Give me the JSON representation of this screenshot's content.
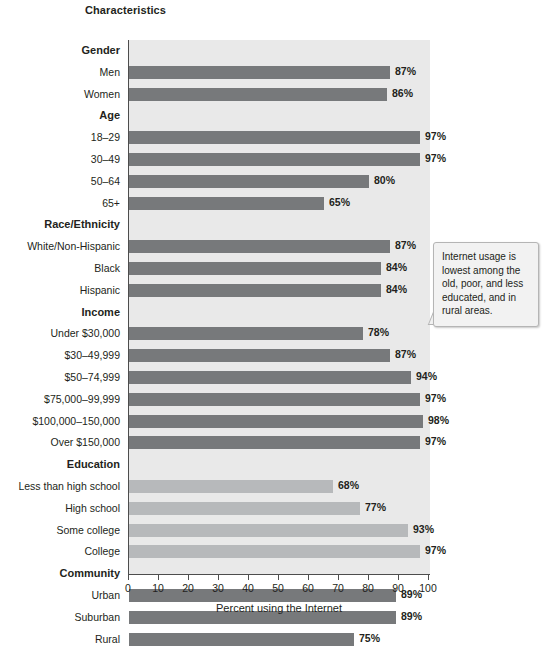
{
  "header": {
    "characteristics_label": "Characteristics"
  },
  "callout": {
    "text": "Internet usage is lowest among the old, poor, and less educated, and in rural areas."
  },
  "axis": {
    "title": "Percent using the Internet",
    "ticks": [
      "0",
      "10",
      "20",
      "30",
      "40",
      "50",
      "60",
      "70",
      "80",
      "90",
      "100"
    ]
  },
  "colors": {
    "bar_dark": "#77797b",
    "bar_light": "#b7b9bb",
    "plot_background": "#e9e9e9",
    "axis": "#4d4d4d",
    "text": "#231f20"
  },
  "chart_data": {
    "type": "bar",
    "orientation": "horizontal",
    "title": "Percent using the Internet",
    "xlabel": "Percent using the Internet",
    "ylabel": "Characteristics",
    "xlim": [
      0,
      100
    ],
    "xticks": [
      0,
      10,
      20,
      30,
      40,
      50,
      60,
      70,
      80,
      90,
      100
    ],
    "grid": false,
    "legend": null,
    "value_suffix": "%",
    "groups": [
      {
        "name": "Gender",
        "shade": "dark",
        "categories": [
          "Men",
          "Women"
        ],
        "values": [
          87,
          86
        ],
        "labels": [
          "87%",
          "86%"
        ]
      },
      {
        "name": "Age",
        "shade": "dark",
        "categories": [
          "18–29",
          "30–49",
          "50–64",
          "65+"
        ],
        "values": [
          97,
          97,
          80,
          65
        ],
        "labels": [
          "97%",
          "97%",
          "80%",
          "65%"
        ]
      },
      {
        "name": "Race/Ethnicity",
        "shade": "dark",
        "categories": [
          "White/Non-Hispanic",
          "Black",
          "Hispanic"
        ],
        "values": [
          87,
          84,
          84
        ],
        "labels": [
          "87%",
          "84%",
          "84%"
        ]
      },
      {
        "name": "Income",
        "shade": "dark",
        "categories": [
          "Under $30,000",
          "$30–49,999",
          "$50–74,999",
          "$75,000–99,999",
          "$100,000–150,000",
          "Over $150,000"
        ],
        "values": [
          78,
          87,
          94,
          97,
          98,
          97
        ],
        "labels": [
          "78%",
          "87%",
          "94%",
          "97%",
          "98%",
          "97%"
        ]
      },
      {
        "name": "Education",
        "shade": "light",
        "categories": [
          "Less than high school",
          "High school",
          "Some college",
          "College"
        ],
        "values": [
          68,
          77,
          93,
          97
        ],
        "labels": [
          "68%",
          "77%",
          "93%",
          "97%"
        ]
      },
      {
        "name": "Community",
        "shade": "dark",
        "categories": [
          "Urban",
          "Suburban",
          "Rural"
        ],
        "values": [
          89,
          89,
          75
        ],
        "labels": [
          "89%",
          "89%",
          "75%"
        ]
      }
    ],
    "annotations": [
      {
        "text": "Internet usage is lowest among the old, poor, and less educated, and in rural areas."
      }
    ]
  }
}
